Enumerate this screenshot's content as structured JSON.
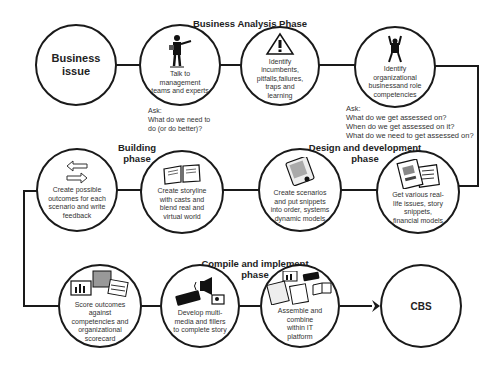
{
  "phases": {
    "business_analysis": "Business Analysis Phase",
    "design_development": "Design and development phase",
    "building": "Building phase",
    "compile_implement": "Compile and implement phase"
  },
  "nodes": [
    {
      "id": "business-issue",
      "label": "Business issue",
      "icon": "none"
    },
    {
      "id": "talk-management",
      "label": "Talk to management teams and experts",
      "icon": "presenter-figure-icon"
    },
    {
      "id": "identify-incumbents",
      "label": "Identify incumbents, pitfalls,failures, traps and learning",
      "icon": "warning-triangle-icon"
    },
    {
      "id": "identify-competencies",
      "label": "Identify organizational businessand role competencies",
      "icon": "cheering-figure-icon"
    },
    {
      "id": "get-real-life",
      "label": "Get various real-life issues, story snippets, financial models",
      "icon": "documents-icon"
    },
    {
      "id": "create-scenarios",
      "label": "Create scenarios and put snippets into order, systems dynamic models",
      "icon": "tablet-device-icon"
    },
    {
      "id": "create-storyline",
      "label": "Create storyline with casts and blend real and virtual world",
      "icon": "open-book-icon"
    },
    {
      "id": "create-outcomes",
      "label": "Create possible outcomes for each scenario and write feedback",
      "icon": "swap-arrows-icon"
    },
    {
      "id": "score-outcomes",
      "label": "Score outcomes against competencies and organizational scorecard",
      "icon": "charts-icon"
    },
    {
      "id": "develop-multimedia",
      "label": "Develop multi-media and fillers to complete story",
      "icon": "multimedia-icon"
    },
    {
      "id": "assemble",
      "label": "Assemble and combine within IT platform",
      "icon": "assets-collage-icon"
    },
    {
      "id": "cbs",
      "label": "CBS",
      "icon": "none"
    }
  ],
  "asks": {
    "ask1": {
      "title": "Ask:",
      "lines": [
        "What do we need to",
        "do (or do better)?"
      ]
    },
    "ask2": {
      "title": "Ask:",
      "lines": [
        "What do we get assessed on?",
        "When do we get assessed on it?",
        "What do we need to get assessed on?"
      ]
    }
  }
}
